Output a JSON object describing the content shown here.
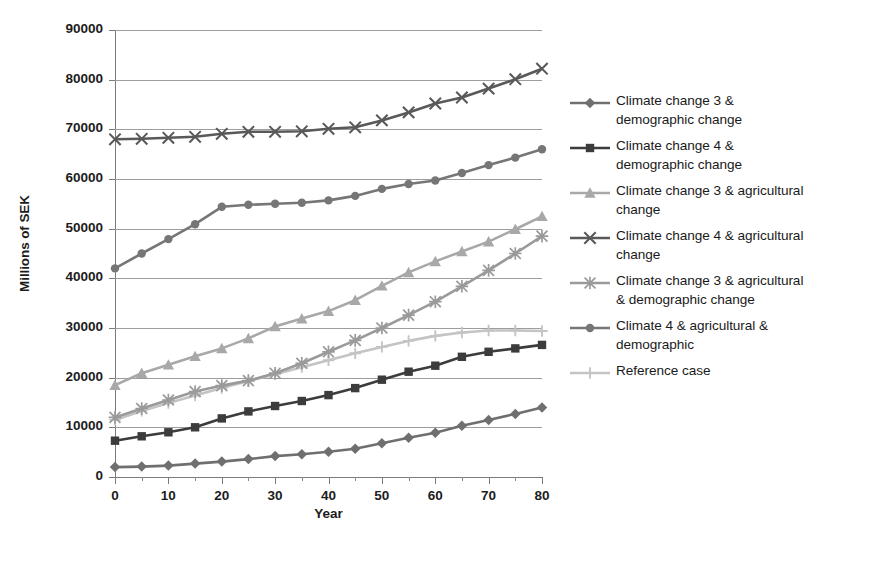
{
  "chart_data": {
    "type": "line",
    "title": "",
    "xlabel": "Year",
    "ylabel": "Millions of SEK",
    "xlim": [
      0,
      80
    ],
    "ylim": [
      0,
      90000
    ],
    "grid": true,
    "legend_position": "right",
    "x_ticks": [
      0,
      10,
      20,
      30,
      40,
      50,
      60,
      70,
      80
    ],
    "x_minor_step": 5,
    "y_ticks": [
      0,
      10000,
      20000,
      30000,
      40000,
      50000,
      60000,
      70000,
      80000,
      90000
    ],
    "x": [
      0,
      5,
      10,
      15,
      20,
      25,
      30,
      35,
      40,
      45,
      50,
      55,
      60,
      65,
      70,
      75,
      80
    ],
    "series": [
      {
        "name": "Climate change 3 & demographic change",
        "label_line1": "Climate change 3 &",
        "label_line2": "demographic change",
        "marker": "diamond",
        "color": "#6f6f6f",
        "values": [
          2000,
          2100,
          2300,
          2700,
          3100,
          3600,
          4200,
          4600,
          5100,
          5700,
          6800,
          7900,
          8900,
          10300,
          11500,
          12700,
          14000
        ]
      },
      {
        "name": "Climate change 4 & demographic change",
        "label_line1": "Climate change 4 &",
        "label_line2": "demographic change",
        "marker": "square",
        "color": "#3c3c3c",
        "values": [
          7300,
          8200,
          9000,
          10000,
          11800,
          13200,
          14300,
          15300,
          16500,
          17900,
          19600,
          21200,
          22400,
          24200,
          25200,
          25900,
          26600
        ]
      },
      {
        "name": "Climate change 3 & agricultural change",
        "label_line1": "Climate change 3 & agricultural",
        "label_line2": "change",
        "marker": "triangle",
        "color": "#a8a8a8",
        "values": [
          18500,
          20900,
          22600,
          24300,
          25900,
          27900,
          30300,
          31900,
          33400,
          35600,
          38500,
          41200,
          43400,
          45400,
          47400,
          49900,
          52500
        ]
      },
      {
        "name": "Climate change 4 & agricultural change",
        "label_line1": "Climate change 4 & agricultural",
        "label_line2": "change",
        "marker": "cross",
        "color": "#595959",
        "values": [
          68000,
          68100,
          68300,
          68500,
          69100,
          69500,
          69500,
          69600,
          70100,
          70400,
          71800,
          73400,
          75200,
          76400,
          78200,
          80100,
          82200
        ]
      },
      {
        "name": "Climate change 3 & agricultural & demographic change",
        "label_line1": "Climate change 3 & agricultural",
        "label_line2": "& demographic change",
        "marker": "star",
        "color": "#9a9a9a",
        "values": [
          12000,
          13800,
          15500,
          17200,
          18400,
          19400,
          20900,
          22900,
          25200,
          27500,
          30000,
          32600,
          35300,
          38400,
          41600,
          45000,
          48500
        ]
      },
      {
        "name": "Climate 4 & agricultural & demographic",
        "label_line1": "Climate 4 & agricultural &",
        "label_line2": "demographic",
        "marker": "circle",
        "color": "#767676",
        "values": [
          42000,
          45000,
          47900,
          50900,
          54400,
          54800,
          55000,
          55200,
          55700,
          56600,
          58000,
          59000,
          59700,
          61200,
          62800,
          64300,
          66000
        ]
      },
      {
        "name": "Reference case",
        "label_line1": "Reference case",
        "label_line2": "",
        "marker": "plus",
        "color": "#c4c4c4",
        "values": [
          11500,
          13300,
          14900,
          16400,
          17900,
          19300,
          20700,
          22100,
          23500,
          24900,
          26200,
          27400,
          28400,
          29100,
          29500,
          29500,
          29400
        ]
      }
    ]
  }
}
